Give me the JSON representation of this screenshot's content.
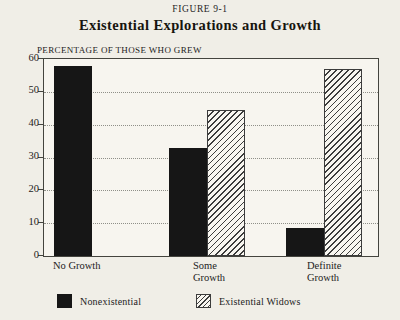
{
  "figure": {
    "label": "FIGURE 9-1",
    "title": "Existential Explorations and Growth",
    "y_axis_caption": "PERCENTAGE OF THOSE WHO GREW"
  },
  "chart_data": {
    "type": "bar",
    "figure_label": "FIGURE 9-1",
    "title": "Existential Explorations and Growth",
    "xlabel": "",
    "ylabel": "PERCENTAGE OF THOSE WHO GREW",
    "categories": [
      "No Growth",
      "Some Growth",
      "Definite Growth"
    ],
    "series": [
      {
        "name": "Nonexistential",
        "fill": "solid",
        "color": "#161616",
        "values": [
          58,
          33,
          8.5
        ]
      },
      {
        "name": "Existential Widows",
        "fill": "hatch",
        "color": "#3c3c3c",
        "values": [
          0,
          44.5,
          57
        ]
      }
    ],
    "ylim": [
      0,
      60
    ],
    "ytick_step": 10,
    "grid": "dotted-horizontal-at-10-through-50",
    "legend_position": "bottom",
    "hatch_direction": "forward-slash"
  },
  "colors": {
    "page_background": "#f0eee7",
    "plot_background": "#f7f5ef",
    "bar_black": "#161616",
    "hatch_line": "#3c3c3c",
    "axis_line": "#44443e",
    "gridline": "#8f8f88",
    "text": "#1e1d1b"
  }
}
